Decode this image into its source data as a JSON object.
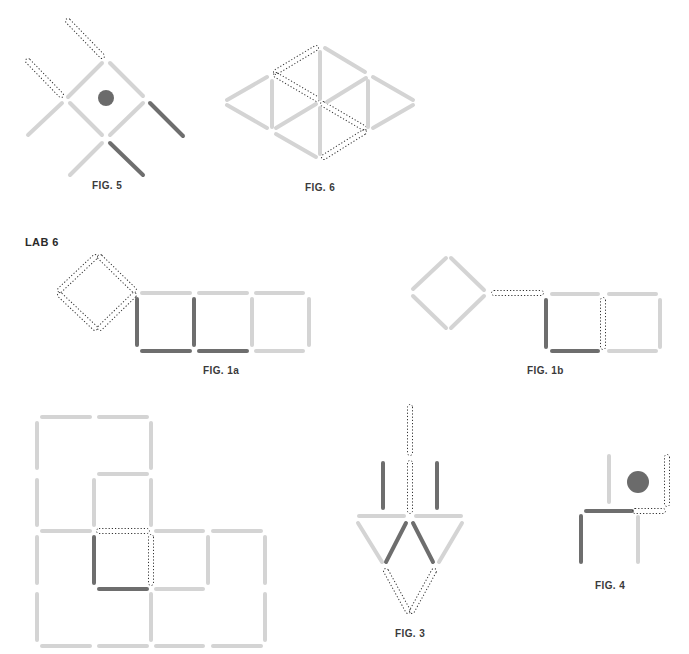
{
  "colors": {
    "light": "#d4d4d4",
    "dark": "#6e6e6e",
    "dashed": "#333333",
    "dot": "#6b6b6b",
    "label": "#3a3a3a"
  },
  "section_label": "LAB 6",
  "figures": [
    {
      "id": "fig5",
      "label": "FIG. 5",
      "label_pos": [
        92,
        180
      ],
      "dots": [
        {
          "cx": 106,
          "cy": 98,
          "r": 8
        }
      ],
      "sticks": [
        {
          "x1": 68,
          "y1": 21,
          "x2": 102,
          "y2": 56,
          "style": "dashed"
        },
        {
          "x1": 28,
          "y1": 61,
          "x2": 61,
          "y2": 95,
          "style": "dashed"
        },
        {
          "x1": 68,
          "y1": 97,
          "x2": 102,
          "y2": 63,
          "style": "light"
        },
        {
          "x1": 110,
          "y1": 63,
          "x2": 143,
          "y2": 96,
          "style": "light"
        },
        {
          "x1": 70,
          "y1": 103,
          "x2": 102,
          "y2": 135,
          "style": "light"
        },
        {
          "x1": 110,
          "y1": 135,
          "x2": 143,
          "y2": 103,
          "style": "light"
        },
        {
          "x1": 28,
          "y1": 135,
          "x2": 62,
          "y2": 103,
          "style": "light"
        },
        {
          "x1": 150,
          "y1": 103,
          "x2": 183,
          "y2": 136,
          "style": "dark"
        },
        {
          "x1": 70,
          "y1": 175,
          "x2": 102,
          "y2": 143,
          "style": "light"
        },
        {
          "x1": 110,
          "y1": 143,
          "x2": 143,
          "y2": 175,
          "style": "dark"
        }
      ]
    },
    {
      "id": "fig6",
      "label": "FIG. 6",
      "label_pos": [
        305,
        182
      ],
      "dots": [],
      "sticks": [
        {
          "x1": 316,
          "y1": 48,
          "x2": 276,
          "y2": 72,
          "style": "dashed"
        },
        {
          "x1": 276,
          "y1": 75,
          "x2": 317,
          "y2": 99,
          "style": "dashed"
        },
        {
          "x1": 323,
          "y1": 104,
          "x2": 364,
          "y2": 128,
          "style": "dashed"
        },
        {
          "x1": 364,
          "y1": 132,
          "x2": 324,
          "y2": 157,
          "style": "dashed"
        },
        {
          "x1": 325,
          "y1": 48,
          "x2": 365,
          "y2": 72,
          "style": "light"
        },
        {
          "x1": 320,
          "y1": 52,
          "x2": 320,
          "y2": 99,
          "style": "light"
        },
        {
          "x1": 320,
          "y1": 108,
          "x2": 320,
          "y2": 154,
          "style": "light"
        },
        {
          "x1": 272,
          "y1": 81,
          "x2": 272,
          "y2": 127,
          "style": "light"
        },
        {
          "x1": 368,
          "y1": 81,
          "x2": 368,
          "y2": 127,
          "style": "light"
        },
        {
          "x1": 227,
          "y1": 100,
          "x2": 267,
          "y2": 77,
          "style": "light"
        },
        {
          "x1": 227,
          "y1": 105,
          "x2": 267,
          "y2": 128,
          "style": "light"
        },
        {
          "x1": 276,
          "y1": 128,
          "x2": 316,
          "y2": 104,
          "style": "light"
        },
        {
          "x1": 327,
          "y1": 102,
          "x2": 366,
          "y2": 78,
          "style": "light"
        },
        {
          "x1": 373,
          "y1": 77,
          "x2": 413,
          "y2": 100,
          "style": "light"
        },
        {
          "x1": 373,
          "y1": 128,
          "x2": 413,
          "y2": 105,
          "style": "light"
        },
        {
          "x1": 276,
          "y1": 134,
          "x2": 316,
          "y2": 157,
          "style": "light"
        }
      ]
    },
    {
      "id": "fig1a",
      "label": "FIG. 1a",
      "label_pos": [
        203,
        365
      ],
      "dots": [],
      "sticks": [
        {
          "x1": 95,
          "y1": 257,
          "x2": 60,
          "y2": 290,
          "style": "dashed"
        },
        {
          "x1": 100,
          "y1": 257,
          "x2": 134,
          "y2": 290,
          "style": "dashed"
        },
        {
          "x1": 60,
          "y1": 295,
          "x2": 95,
          "y2": 328,
          "style": "dashed"
        },
        {
          "x1": 134,
          "y1": 295,
          "x2": 100,
          "y2": 328,
          "style": "dashed"
        },
        {
          "x1": 142,
          "y1": 293,
          "x2": 190,
          "y2": 293,
          "style": "light"
        },
        {
          "x1": 199,
          "y1": 293,
          "x2": 247,
          "y2": 293,
          "style": "light"
        },
        {
          "x1": 256,
          "y1": 293,
          "x2": 303,
          "y2": 293,
          "style": "light"
        },
        {
          "x1": 137,
          "y1": 299,
          "x2": 137,
          "y2": 345,
          "style": "dark"
        },
        {
          "x1": 194,
          "y1": 299,
          "x2": 194,
          "y2": 345,
          "style": "dark"
        },
        {
          "x1": 252,
          "y1": 299,
          "x2": 252,
          "y2": 345,
          "style": "light"
        },
        {
          "x1": 309,
          "y1": 299,
          "x2": 309,
          "y2": 345,
          "style": "light"
        },
        {
          "x1": 142,
          "y1": 351,
          "x2": 190,
          "y2": 351,
          "style": "dark"
        },
        {
          "x1": 199,
          "y1": 351,
          "x2": 247,
          "y2": 351,
          "style": "dark"
        },
        {
          "x1": 256,
          "y1": 351,
          "x2": 303,
          "y2": 351,
          "style": "light"
        }
      ]
    },
    {
      "id": "fig1b",
      "label": "FIG. 1b",
      "label_pos": [
        527,
        365
      ],
      "dots": [],
      "sticks": [
        {
          "x1": 446,
          "y1": 258,
          "x2": 413,
          "y2": 289,
          "style": "light"
        },
        {
          "x1": 451,
          "y1": 258,
          "x2": 484,
          "y2": 290,
          "style": "light"
        },
        {
          "x1": 413,
          "y1": 296,
          "x2": 446,
          "y2": 328,
          "style": "light"
        },
        {
          "x1": 484,
          "y1": 296,
          "x2": 451,
          "y2": 328,
          "style": "light"
        },
        {
          "x1": 494,
          "y1": 293,
          "x2": 541,
          "y2": 293,
          "style": "dashed"
        },
        {
          "x1": 552,
          "y1": 294,
          "x2": 598,
          "y2": 294,
          "style": "light"
        },
        {
          "x1": 609,
          "y1": 294,
          "x2": 656,
          "y2": 294,
          "style": "light"
        },
        {
          "x1": 546,
          "y1": 300,
          "x2": 546,
          "y2": 347,
          "style": "dark"
        },
        {
          "x1": 603,
          "y1": 300,
          "x2": 603,
          "y2": 347,
          "style": "dashed"
        },
        {
          "x1": 660,
          "y1": 300,
          "x2": 660,
          "y2": 347,
          "style": "light"
        },
        {
          "x1": 552,
          "y1": 351,
          "x2": 598,
          "y2": 351,
          "style": "dark"
        },
        {
          "x1": 609,
          "y1": 351,
          "x2": 656,
          "y2": 351,
          "style": "light"
        }
      ]
    },
    {
      "id": "fig2",
      "label": "",
      "label_pos": null,
      "dots": [],
      "sticks": [
        {
          "x1": 42,
          "y1": 417,
          "x2": 90,
          "y2": 417,
          "style": "light"
        },
        {
          "x1": 99,
          "y1": 417,
          "x2": 147,
          "y2": 417,
          "style": "light"
        },
        {
          "x1": 37,
          "y1": 423,
          "x2": 37,
          "y2": 468,
          "style": "light"
        },
        {
          "x1": 151,
          "y1": 423,
          "x2": 151,
          "y2": 468,
          "style": "light"
        },
        {
          "x1": 99,
          "y1": 474,
          "x2": 147,
          "y2": 474,
          "style": "light"
        },
        {
          "x1": 37,
          "y1": 480,
          "x2": 37,
          "y2": 525,
          "style": "light"
        },
        {
          "x1": 94,
          "y1": 480,
          "x2": 94,
          "y2": 525,
          "style": "light"
        },
        {
          "x1": 151,
          "y1": 480,
          "x2": 151,
          "y2": 525,
          "style": "light"
        },
        {
          "x1": 42,
          "y1": 531,
          "x2": 90,
          "y2": 531,
          "style": "light"
        },
        {
          "x1": 99,
          "y1": 531,
          "x2": 147,
          "y2": 531,
          "style": "dashed"
        },
        {
          "x1": 156,
          "y1": 531,
          "x2": 203,
          "y2": 531,
          "style": "light"
        },
        {
          "x1": 213,
          "y1": 531,
          "x2": 261,
          "y2": 531,
          "style": "light"
        },
        {
          "x1": 37,
          "y1": 537,
          "x2": 37,
          "y2": 583,
          "style": "light"
        },
        {
          "x1": 94,
          "y1": 537,
          "x2": 94,
          "y2": 583,
          "style": "dark"
        },
        {
          "x1": 151,
          "y1": 537,
          "x2": 151,
          "y2": 583,
          "style": "dashed"
        },
        {
          "x1": 208,
          "y1": 537,
          "x2": 208,
          "y2": 583,
          "style": "light"
        },
        {
          "x1": 265,
          "y1": 537,
          "x2": 265,
          "y2": 583,
          "style": "light"
        },
        {
          "x1": 99,
          "y1": 589,
          "x2": 147,
          "y2": 589,
          "style": "dark"
        },
        {
          "x1": 156,
          "y1": 589,
          "x2": 203,
          "y2": 589,
          "style": "light"
        },
        {
          "x1": 37,
          "y1": 594,
          "x2": 37,
          "y2": 640,
          "style": "light"
        },
        {
          "x1": 151,
          "y1": 594,
          "x2": 151,
          "y2": 640,
          "style": "light"
        },
        {
          "x1": 265,
          "y1": 594,
          "x2": 265,
          "y2": 640,
          "style": "light"
        },
        {
          "x1": 42,
          "y1": 646,
          "x2": 90,
          "y2": 646,
          "style": "light"
        },
        {
          "x1": 99,
          "y1": 646,
          "x2": 147,
          "y2": 646,
          "style": "light"
        },
        {
          "x1": 156,
          "y1": 646,
          "x2": 203,
          "y2": 646,
          "style": "light"
        },
        {
          "x1": 213,
          "y1": 646,
          "x2": 261,
          "y2": 646,
          "style": "light"
        }
      ]
    },
    {
      "id": "fig3",
      "label": "FIG. 3",
      "label_pos": [
        395,
        628
      ],
      "dots": [],
      "sticks": [
        {
          "x1": 410,
          "y1": 407,
          "x2": 410,
          "y2": 453,
          "style": "dashed"
        },
        {
          "x1": 410,
          "y1": 463,
          "x2": 410,
          "y2": 511,
          "style": "dashed"
        },
        {
          "x1": 383,
          "y1": 463,
          "x2": 383,
          "y2": 508,
          "style": "dark"
        },
        {
          "x1": 437,
          "y1": 463,
          "x2": 437,
          "y2": 508,
          "style": "dark"
        },
        {
          "x1": 359,
          "y1": 516,
          "x2": 404,
          "y2": 516,
          "style": "light"
        },
        {
          "x1": 416,
          "y1": 516,
          "x2": 461,
          "y2": 516,
          "style": "light"
        },
        {
          "x1": 358,
          "y1": 523,
          "x2": 382,
          "y2": 562,
          "style": "light"
        },
        {
          "x1": 406,
          "y1": 523,
          "x2": 386,
          "y2": 562,
          "style": "dark"
        },
        {
          "x1": 413,
          "y1": 523,
          "x2": 433,
          "y2": 562,
          "style": "dark"
        },
        {
          "x1": 462,
          "y1": 523,
          "x2": 439,
          "y2": 562,
          "style": "light"
        },
        {
          "x1": 386,
          "y1": 571,
          "x2": 408,
          "y2": 611,
          "style": "dashed"
        },
        {
          "x1": 434,
          "y1": 571,
          "x2": 412,
          "y2": 611,
          "style": "dashed"
        }
      ]
    },
    {
      "id": "fig4",
      "label": "FIG. 4",
      "label_pos": [
        595,
        580
      ],
      "dots": [
        {
          "cx": 638,
          "cy": 482,
          "r": 11
        }
      ],
      "sticks": [
        {
          "x1": 609,
          "y1": 456,
          "x2": 609,
          "y2": 502,
          "style": "light"
        },
        {
          "x1": 667,
          "y1": 457,
          "x2": 667,
          "y2": 504,
          "style": "dashed"
        },
        {
          "x1": 586,
          "y1": 511,
          "x2": 632,
          "y2": 511,
          "style": "dark"
        },
        {
          "x1": 635,
          "y1": 511,
          "x2": 663,
          "y2": 511,
          "style": "dashed"
        },
        {
          "x1": 581,
          "y1": 516,
          "x2": 581,
          "y2": 562,
          "style": "dark"
        },
        {
          "x1": 638,
          "y1": 517,
          "x2": 638,
          "y2": 562,
          "style": "light"
        }
      ]
    }
  ]
}
